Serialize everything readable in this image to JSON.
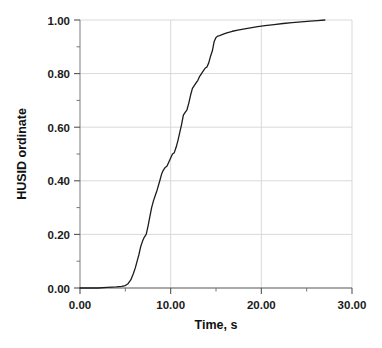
{
  "chart_data": {
    "type": "line",
    "title": "",
    "xlabel": "Time, s",
    "ylabel": "HUSID ordinate",
    "xlim": [
      0,
      30
    ],
    "ylim": [
      0,
      1.0
    ],
    "xticks": [
      0,
      10,
      20,
      30
    ],
    "xtick_labels": [
      "0.00",
      "10.00",
      "20.00",
      "30.00"
    ],
    "yticks": [
      0,
      0.2,
      0.4,
      0.6,
      0.8,
      1.0
    ],
    "ytick_labels": [
      "0.00",
      "0.20",
      "0.40",
      "0.60",
      "0.80",
      "1.00"
    ],
    "x_minor_interval": 5,
    "y_minor_interval": 0.1,
    "grid": true,
    "grid_color": "#d9d9d9",
    "line_color": "#1c1c1c",
    "line_width": 1.3,
    "legend": null,
    "series": [
      {
        "name": "HUSID",
        "x": [
          0.0,
          1.0,
          2.0,
          3.0,
          4.0,
          4.6,
          5.0,
          5.3,
          5.6,
          5.9,
          6.1,
          6.3,
          6.5,
          6.7,
          6.9,
          7.1,
          7.3,
          7.5,
          7.7,
          7.9,
          8.1,
          8.3,
          8.5,
          8.8,
          9.0,
          9.2,
          9.4,
          9.6,
          9.8,
          10.0,
          10.2,
          10.4,
          10.6,
          10.8,
          11.0,
          11.2,
          11.4,
          11.6,
          11.8,
          12.0,
          12.2,
          12.4,
          12.6,
          12.8,
          13.0,
          13.2,
          13.4,
          13.6,
          13.8,
          14.0,
          14.2,
          14.4,
          14.6,
          14.8,
          15.0,
          15.2,
          15.4,
          15.8,
          16.2,
          16.8,
          17.4,
          18.0,
          18.8,
          19.6,
          20.4,
          21.4,
          22.4,
          23.4,
          24.4,
          25.4,
          26.2,
          27.0
        ],
        "y": [
          0.0,
          0.0,
          0.0,
          0.002,
          0.004,
          0.006,
          0.009,
          0.016,
          0.03,
          0.055,
          0.075,
          0.1,
          0.125,
          0.155,
          0.175,
          0.19,
          0.2,
          0.23,
          0.265,
          0.3,
          0.325,
          0.345,
          0.365,
          0.4,
          0.425,
          0.44,
          0.45,
          0.455,
          0.47,
          0.485,
          0.5,
          0.505,
          0.525,
          0.55,
          0.58,
          0.61,
          0.645,
          0.655,
          0.665,
          0.69,
          0.72,
          0.745,
          0.755,
          0.765,
          0.775,
          0.79,
          0.8,
          0.81,
          0.82,
          0.825,
          0.84,
          0.865,
          0.885,
          0.92,
          0.935,
          0.94,
          0.942,
          0.947,
          0.952,
          0.958,
          0.962,
          0.966,
          0.971,
          0.975,
          0.979,
          0.983,
          0.987,
          0.99,
          0.993,
          0.996,
          0.998,
          1.0
        ]
      }
    ]
  },
  "axes": {
    "x_title": "Time, s",
    "y_title": "HUSID ordinate"
  },
  "caption": {
    "partial_text": ""
  }
}
